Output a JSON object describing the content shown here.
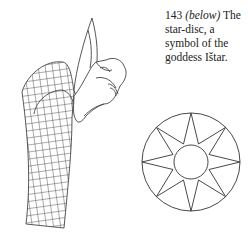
{
  "figure": {
    "number": "143",
    "position_note": "(below)",
    "caption_text": "The star-disc, a symbol of the goddess Ištar."
  },
  "illustrations": [
    {
      "name": "dragon-head-drawing",
      "description": "line drawing of a horned serpent-dragon head with scaled neck"
    },
    {
      "name": "star-disc-drawing",
      "description": "eight-pointed star within a circle with central disc"
    }
  ]
}
